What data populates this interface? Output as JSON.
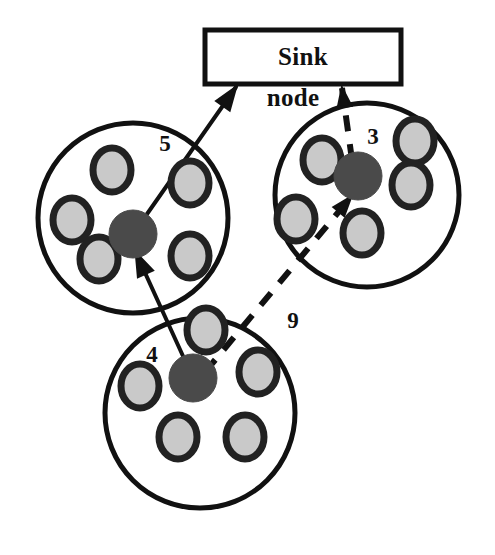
{
  "diagram": {
    "title_box": {
      "label_line1": "Sink",
      "label_line2": "node",
      "x": 205,
      "y": 30,
      "width": 196,
      "height": 54,
      "stroke": "#111111",
      "fill": "#ffffff"
    },
    "colors": {
      "outline": "#111111",
      "cluster_head_fill": "#4a4a4a",
      "member_ring": "#222222",
      "member_fill": "#c9c9c9",
      "background": "#ffffff"
    },
    "clusters": [
      {
        "id": "cluster-left",
        "name": "left-cluster",
        "cx": 133,
        "cy": 218,
        "r": 95,
        "head": {
          "cx": 133,
          "cy": 234,
          "r": 24
        },
        "members": [
          {
            "cx": 112,
            "cy": 170,
            "rx": 19,
            "ry": 22
          },
          {
            "cx": 190,
            "cy": 183,
            "rx": 19,
            "ry": 22
          },
          {
            "cx": 72,
            "cy": 220,
            "rx": 19,
            "ry": 22
          },
          {
            "cx": 99,
            "cy": 259,
            "rx": 19,
            "ry": 22
          },
          {
            "cx": 190,
            "cy": 256,
            "rx": 19,
            "ry": 22
          }
        ]
      },
      {
        "id": "cluster-right",
        "name": "right-cluster",
        "cx": 367,
        "cy": 195,
        "r": 92,
        "head": {
          "cx": 358,
          "cy": 176,
          "r": 24
        },
        "members": [
          {
            "cx": 322,
            "cy": 160,
            "rx": 19,
            "ry": 22
          },
          {
            "cx": 415,
            "cy": 141,
            "rx": 19,
            "ry": 22
          },
          {
            "cx": 411,
            "cy": 185,
            "rx": 19,
            "ry": 22
          },
          {
            "cx": 296,
            "cy": 219,
            "rx": 19,
            "ry": 22
          },
          {
            "cx": 362,
            "cy": 233,
            "rx": 19,
            "ry": 22
          }
        ]
      },
      {
        "id": "cluster-bottom",
        "name": "bottom-cluster",
        "cx": 200,
        "cy": 413,
        "r": 95,
        "head": {
          "cx": 193,
          "cy": 378,
          "r": 24
        },
        "members": [
          {
            "cx": 206,
            "cy": 330,
            "rx": 19,
            "ry": 22
          },
          {
            "cx": 258,
            "cy": 372,
            "rx": 19,
            "ry": 22
          },
          {
            "cx": 140,
            "cy": 386,
            "rx": 19,
            "ry": 22
          },
          {
            "cx": 178,
            "cy": 437,
            "rx": 19,
            "ry": 22
          },
          {
            "cx": 245,
            "cy": 437,
            "rx": 19,
            "ry": 22
          }
        ]
      }
    ],
    "edges": [
      {
        "id": "edge-left-to-sink",
        "name": "left-cluster-to-sink",
        "from": "cluster-left-head",
        "to": "sink-node",
        "style": "solid",
        "weight": "5",
        "label_x": 165,
        "label_y": 146,
        "x1": 133,
        "y1": 234,
        "x2": 236,
        "y2": 87
      },
      {
        "id": "edge-bottom-to-left",
        "name": "bottom-cluster-to-left-cluster",
        "from": "cluster-bottom-head",
        "to": "cluster-left-head",
        "style": "solid",
        "weight": "4",
        "label_x": 152,
        "label_y": 357,
        "x1": 193,
        "y1": 378,
        "x2": 136,
        "y2": 253
      },
      {
        "id": "edge-bottom-to-right",
        "name": "bottom-cluster-to-right-cluster",
        "from": "cluster-bottom-head",
        "to": "cluster-right-head",
        "style": "dashed",
        "weight": "9",
        "label_x": 293,
        "label_y": 323,
        "x1": 205,
        "y1": 372,
        "x2": 351,
        "y2": 197
      },
      {
        "id": "edge-right-to-sink",
        "name": "right-cluster-to-sink",
        "from": "cluster-right-head",
        "to": "sink-node",
        "style": "dashed",
        "weight": "3",
        "label_x": 373,
        "label_y": 139,
        "x1": 352,
        "y1": 160,
        "x2": 342,
        "y2": 88
      }
    ]
  }
}
